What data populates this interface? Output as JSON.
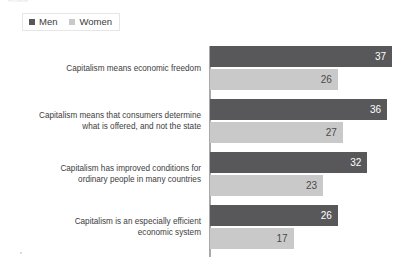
{
  "top_caption": "Anteile",
  "legend": {
    "position": "top-left",
    "items": [
      {
        "label": "Men",
        "color": "#58585a",
        "swatch_icon": "square-swatch-icon"
      },
      {
        "label": "Women",
        "color": "#c9c9c9",
        "swatch_icon": "square-swatch-icon"
      }
    ]
  },
  "chart_data": {
    "type": "bar",
    "orientation": "horizontal",
    "title": "",
    "subtitle": "",
    "xlabel": "",
    "ylabel": "",
    "xlim": [
      0,
      40
    ],
    "grid": false,
    "legend_position": "top-left",
    "categories": [
      "Capitalism means economic freedom",
      "Capitalism means that consumers determine what is offered, and not the state",
      "Capitalism has improved conditions for ordinary people in many countries",
      "Capitalism is an especially efficient economic system"
    ],
    "category_lines": [
      [
        "Capitalism means economic freedom"
      ],
      [
        "Capitalism means that consumers determine",
        "what is offered, and not the state"
      ],
      [
        "Capitalism has improved conditions for",
        "ordinary people in many countries"
      ],
      [
        "Capitalism is an especially efficient",
        "economic system"
      ]
    ],
    "series": [
      {
        "name": "Men",
        "color": "#58585a",
        "values": [
          37,
          36,
          32,
          26
        ]
      },
      {
        "name": "Women",
        "color": "#c9c9c9",
        "values": [
          26,
          27,
          23,
          17
        ]
      }
    ]
  }
}
